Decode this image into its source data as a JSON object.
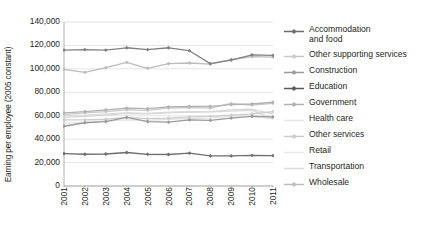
{
  "chart_data": {
    "type": "line",
    "title": "",
    "xlabel": "",
    "ylabel": "Earning per employee (2005 constant)",
    "x": [
      2001,
      2002,
      2003,
      2004,
      2005,
      2006,
      2007,
      2008,
      2009,
      2010,
      2011
    ],
    "xtick_labels": [
      "2001",
      "2002",
      "2003",
      "2004",
      "2005",
      "2006",
      "2007",
      "2008",
      "2009",
      "2010",
      "2011"
    ],
    "ytick_labels": [
      "140,000",
      "120,000",
      "100,000",
      "80,000",
      "60,000",
      "40,000",
      "20,000",
      "0"
    ],
    "ytick_values": [
      140000,
      120000,
      100000,
      80000,
      60000,
      40000,
      20000,
      0
    ],
    "ylim": [
      0,
      140000
    ],
    "xlim": [
      2001,
      2011
    ],
    "grid": "horizontal",
    "legend_position": "right",
    "series": [
      {
        "name": "Accommodation and food",
        "color": "#6e6e6e",
        "marker": "diamond",
        "values": [
          27700,
          27100,
          27300,
          28600,
          27000,
          26900,
          28000,
          25800,
          25700,
          26100,
          26000
        ]
      },
      {
        "name": "Other supporting services",
        "color": "#c9c9c9",
        "marker": "diamond",
        "values": [
          61000,
          62500,
          63500,
          65000,
          64500,
          66500,
          67000,
          66500,
          70500,
          69000,
          70500
        ]
      },
      {
        "name": "Construction",
        "color": "#9a9a9a",
        "marker": "diamond",
        "values": [
          51000,
          54000,
          55000,
          58500,
          55000,
          54500,
          56500,
          56000,
          58000,
          59500,
          59000
        ]
      },
      {
        "name": "Education",
        "color": "#808080",
        "marker": "diamond",
        "values": [
          116000,
          116500,
          116000,
          118000,
          116500,
          118000,
          115500,
          104500,
          107500,
          112000,
          111500
        ]
      },
      {
        "name": "Government",
        "color": "#b0b0b0",
        "marker": "diamond",
        "values": [
          62500,
          63500,
          65000,
          66500,
          66000,
          67500,
          68000,
          68000,
          69500,
          70000,
          71500
        ]
      },
      {
        "name": "Health care",
        "color": "#dcdcdc",
        "marker": "none",
        "values": [
          60000,
          60500,
          61500,
          62500,
          62000,
          63000,
          63500,
          63000,
          64000,
          64500,
          57500
        ]
      },
      {
        "name": "Other services",
        "color": "#cccccc",
        "marker": "diamond",
        "values": [
          56500,
          56500,
          57000,
          58500,
          57500,
          58000,
          59000,
          59500,
          60500,
          61500,
          63500
        ]
      },
      {
        "name": "Retail",
        "color": "#e2e2e2",
        "marker": "none",
        "values": [
          53500,
          54500,
          55500,
          56500,
          56000,
          57000,
          57500,
          58000,
          59500,
          60000,
          57000
        ]
      },
      {
        "name": "Transportation",
        "color": "#d5d5d5",
        "marker": "none",
        "values": [
          58500,
          59500,
          60500,
          62000,
          61500,
          62500,
          63000,
          63500,
          65000,
          65500,
          61500
        ]
      },
      {
        "name": "Wholesale",
        "color": "#bcbcbc",
        "marker": "diamond",
        "values": [
          99500,
          97000,
          101000,
          105500,
          100500,
          104500,
          105000,
          104000,
          108000,
          110500,
          110000
        ]
      }
    ]
  },
  "legend": {
    "items": [
      {
        "label": "Accommodation\nand food",
        "color": "#6e6e6e",
        "marker": "diamond"
      },
      {
        "label": "Other supporting services",
        "color": "#c9c9c9",
        "marker": "diamond"
      },
      {
        "label": "Construction",
        "color": "#9a9a9a",
        "marker": "diamond"
      },
      {
        "label": "Education",
        "color": "#595959",
        "marker": "diamond"
      },
      {
        "label": "Government",
        "color": "#b0b0b0",
        "marker": "diamond"
      },
      {
        "label": "Health care",
        "color": "#e4e4e4",
        "marker": "none"
      },
      {
        "label": "Other services",
        "color": "#cccccc",
        "marker": "diamond"
      },
      {
        "label": "Retail",
        "color": "#e8e8e8",
        "marker": "none"
      },
      {
        "label": "Transportation",
        "color": "#dadada",
        "marker": "none"
      },
      {
        "label": "Wholesale",
        "color": "#bcbcbc",
        "marker": "diamond"
      }
    ]
  },
  "axes": {
    "ylabel": "Earning per employee (2005 constant)",
    "grid_color": "#d9d9d9",
    "axis_color": "#9a9a9a",
    "text_color": "#231f20"
  }
}
